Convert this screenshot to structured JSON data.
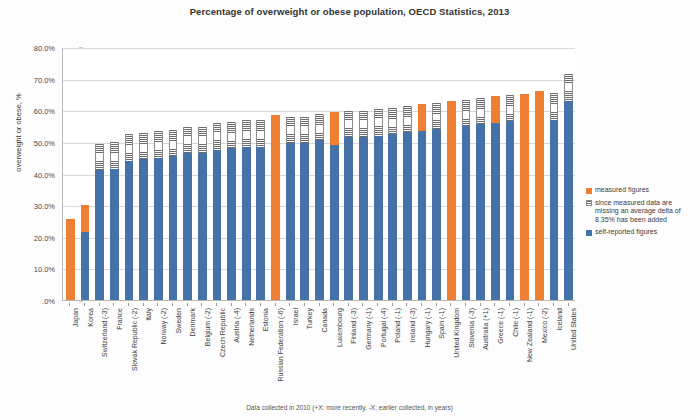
{
  "chart_data": {
    "type": "bar",
    "stacked": true,
    "title": "Percentage of overweight or obese population, OECD Statistics, 2013",
    "xlabel": "",
    "ylabel": "overweight or obese, %",
    "ylim": [
      0,
      80
    ],
    "ytick_labels": [
      ".0%",
      "10.0%",
      "20.0%",
      "30.0%",
      "40.0%",
      "50.0%",
      "60.0%",
      "70.0%",
      "80.0%"
    ],
    "ytick_values": [
      0,
      10,
      20,
      30,
      40,
      50,
      60,
      70,
      80
    ],
    "grid": true,
    "legend_position": "right",
    "categories": [
      "Japan",
      "Korea",
      "Switzerland (-3)",
      "France",
      "Slovak Republic (-2)",
      "Italy",
      "Norway (-2)",
      "Sweden",
      "Denmark",
      "Belgium (-2)",
      "Czech Republic",
      "Austria (-4)",
      "Netherlands",
      "Estonia",
      "Russian Federation (-6)",
      "Israel",
      "Turkey",
      "Canada",
      "Luxembourg",
      "Finland (-3)",
      "Germany (-1)",
      "Portugal (-4)",
      "Poland (-1)",
      "Ireland (-3)",
      "Hungary (-1)",
      "Spain (-1)",
      "United Kingdom",
      "Slovenia (-3)",
      "Australia (+1)",
      "Greece (-1)",
      "Chile (-1)",
      "New Zealand (-1)",
      "Mexico (-2)",
      "Iceland",
      "United States"
    ],
    "series": [
      {
        "name": "self-reported figures",
        "color": "#4572a7",
        "values": [
          0,
          21.5,
          41.0,
          41.5,
          44.0,
          44.5,
          45.0,
          45.5,
          46.5,
          46.5,
          47.5,
          48.0,
          48.5,
          48.5,
          0,
          49.5,
          49.5,
          50.5,
          49.0,
          51.5,
          51.5,
          52.0,
          52.5,
          53.0,
          53.5,
          54.0,
          0,
          55.0,
          55.5,
          56.0,
          56.5,
          0,
          0,
          57.0,
          63.0
        ]
      },
      {
        "name": "since measured data are missing an average delta of 8.35% has been added",
        "color": "#ffffff",
        "pattern": "horizontal-hatch",
        "values": [
          0,
          0,
          8.35,
          8.35,
          8.35,
          8.35,
          8.35,
          8.35,
          8.35,
          8.35,
          8.35,
          8.35,
          8.35,
          8.35,
          0,
          8.35,
          8.35,
          8.35,
          0,
          8.35,
          8.35,
          8.35,
          8.35,
          8.35,
          0,
          8.35,
          0,
          8.35,
          8.35,
          0,
          8.35,
          0,
          0,
          8.35,
          8.35
        ]
      },
      {
        "name": "measured figures",
        "color": "#ef8033",
        "values": [
          25.5,
          8.5,
          0,
          0,
          0,
          0,
          0,
          0,
          0,
          0,
          0,
          0,
          0,
          0,
          58.5,
          0,
          0,
          0,
          10.5,
          0,
          0,
          0,
          0,
          0,
          8.5,
          0,
          63.0,
          0,
          0,
          8.5,
          0,
          65.0,
          66.0,
          0,
          0
        ]
      }
    ],
    "totals": [
      25.5,
      30.0,
      49.35,
      49.85,
      52.35,
      52.85,
      53.35,
      53.85,
      54.85,
      54.85,
      55.85,
      56.35,
      56.85,
      56.85,
      58.5,
      57.85,
      57.85,
      58.85,
      59.5,
      59.85,
      59.85,
      60.35,
      60.85,
      61.35,
      62.0,
      62.35,
      63.0,
      63.35,
      63.85,
      64.5,
      64.85,
      65.0,
      66.0,
      65.35,
      71.35
    ]
  },
  "legend": {
    "items": [
      {
        "swatch": "measured",
        "label": "measured figures"
      },
      {
        "swatch": "delta",
        "label": "since measured data are missing an average delta of 8.35% has been added"
      },
      {
        "swatch": "self",
        "label": "self-reported figures"
      }
    ]
  },
  "footnote": "Data collected in 2010 (+X: more recently, -X: earlier collected, in years)"
}
